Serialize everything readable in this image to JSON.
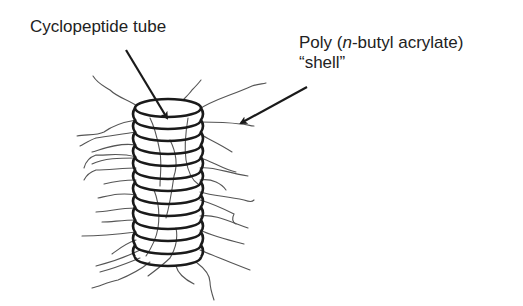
{
  "diagram": {
    "labels": {
      "tube": "Cyclopeptide tube",
      "shell_line1_prefix": "Poly (",
      "shell_line1_italic": "n",
      "shell_line1_suffix": "-butyl acrylate)",
      "shell_line2": "“shell”"
    },
    "colors": {
      "text": "#222222",
      "ring_stroke": "#1a1a1a",
      "chain_stroke": "#555555",
      "arrow": "#1a1a1a",
      "background": "#ffffff"
    },
    "tube": {
      "center_x": 168,
      "top_y": 108,
      "ring_rx": 33,
      "ring_ry": 9,
      "ring_count": 13,
      "ring_spacing": 12.5
    },
    "arrows": [
      {
        "name": "tube-pointer",
        "from": [
          126,
          50
        ],
        "to": [
          167,
          118
        ]
      },
      {
        "name": "shell-pointer",
        "from": [
          307,
          87
        ],
        "to": [
          241,
          123
        ]
      }
    ]
  }
}
